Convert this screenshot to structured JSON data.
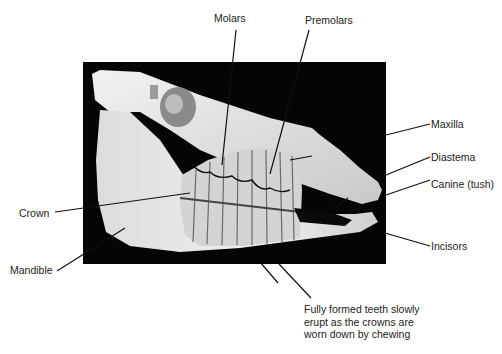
{
  "figure": {
    "photo": {
      "subject": "lateral view of horse skull with exposed tooth roots",
      "background": "#050505"
    },
    "labels": [
      {
        "id": "molars",
        "text": "Molars"
      },
      {
        "id": "premolars",
        "text": "Premolars"
      },
      {
        "id": "maxilla",
        "text": "Maxilla"
      },
      {
        "id": "diastema",
        "text": "Diastema"
      },
      {
        "id": "canine",
        "text": "Canine (tush)"
      },
      {
        "id": "incisors",
        "text": "Incisors"
      },
      {
        "id": "crown",
        "text": "Crown"
      },
      {
        "id": "mandible",
        "text": "Mandible"
      }
    ],
    "caption": {
      "line1": "Fully formed teeth slowly",
      "line2": "erupt as the crowns are",
      "line3": "worn down by chewing"
    },
    "colors": {
      "text": "#222222",
      "leader": "#111111",
      "bone": "#e6e6e6"
    }
  }
}
